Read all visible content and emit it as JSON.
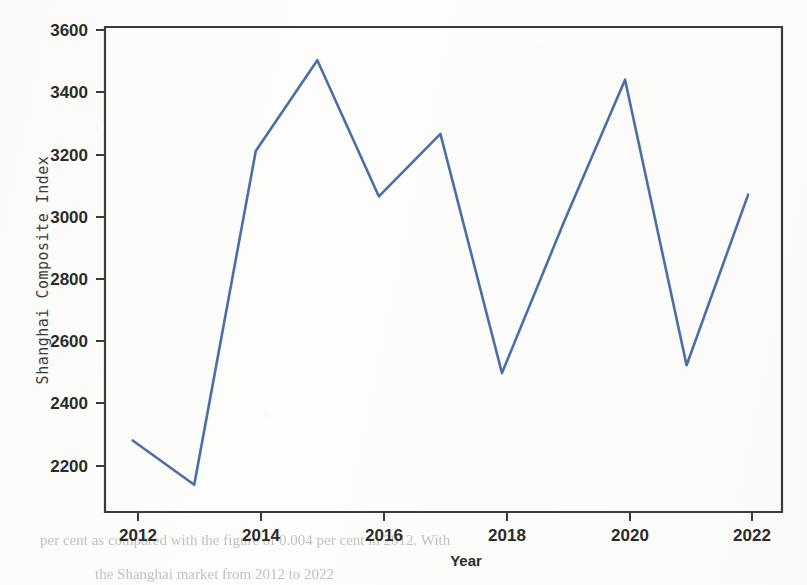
{
  "chart_data": {
    "type": "line",
    "title": "",
    "xlabel": "Year",
    "ylabel": "Shanghai Composite Index",
    "x": [
      2012,
      2013,
      2014,
      2015,
      2016,
      2017,
      2018,
      2019,
      2020,
      2021,
      2022
    ],
    "values": [
      2269,
      2121,
      3236,
      3539,
      3084,
      3293,
      2494,
      2995,
      3474,
      2520,
      3090
    ],
    "series": [
      {
        "name": "Shanghai Composite Index",
        "values": [
          2269,
          2121,
          3236,
          3539,
          3084,
          3293,
          2494,
          2995,
          3474,
          2520,
          3090
        ]
      }
    ],
    "xlim": [
      2011.55,
      2022.55
    ],
    "ylim": [
      2030,
      3650
    ],
    "xticks": [
      2012,
      2014,
      2016,
      2018,
      2020,
      2022
    ],
    "xtick_labels": [
      "2012",
      "2014",
      "2016",
      "2018",
      "2020",
      "2022"
    ],
    "yticks": [
      2200,
      2400,
      2600,
      2800,
      3000,
      3200,
      3400,
      3600
    ],
    "ytick_labels": [
      "2200",
      "2400",
      "2600",
      "2800",
      "3000",
      "3200",
      "3400",
      "3600"
    ],
    "grid": false,
    "legend": false,
    "line_color": "#4a6fa5",
    "axis_color": "#3b3b3b"
  },
  "axes": {
    "x_title": "Year",
    "y_title": "Shanghai Composite Index"
  },
  "ticks": {
    "x": [
      "2012",
      "2014",
      "2016",
      "2018",
      "2020",
      "2022"
    ],
    "y": [
      "3600",
      "3400",
      "3200",
      "3000",
      "2800",
      "2600",
      "2400",
      "2200"
    ]
  },
  "artifacts": {
    "bottom_line_1": "per cent as compared with the figure of 0.004 per cent in 2012. With",
    "bottom_line_2": "the Shanghai market from 2012 to 2022"
  }
}
